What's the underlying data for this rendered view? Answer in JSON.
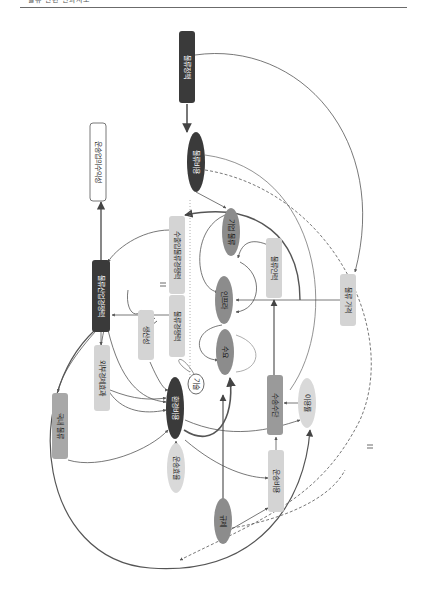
{
  "page": {
    "header_text": "물류 관련 인과지도",
    "rotation_deg": 90
  },
  "colors": {
    "dark_node": "#3a3a3a",
    "mid_node": "#8c8c8c",
    "light_node": "#d4d4d4",
    "edge": "#555555",
    "edge_light": "#9a9a9a"
  },
  "diagram": {
    "nodes": [
      {
        "id": "n1",
        "label": "물류정책",
        "shape": "box",
        "style": "dark",
        "x": 187,
        "y": 67,
        "w": 16,
        "h": 72
      },
      {
        "id": "n2",
        "label": "물류비용",
        "shape": "ellipse",
        "style": "dark",
        "x": 196,
        "y": 162,
        "w": 18,
        "h": 60
      },
      {
        "id": "n3",
        "label": "운송업의수익성",
        "shape": "box",
        "style": "white",
        "x": 98,
        "y": 162,
        "w": 16,
        "h": 78
      },
      {
        "id": "n4",
        "label": "수출입물류경쟁력",
        "shape": "box",
        "style": "light",
        "x": 177,
        "y": 255,
        "w": 16,
        "h": 78
      },
      {
        "id": "n5",
        "label": "기업 물류",
        "shape": "ellipse",
        "style": "mid",
        "x": 231,
        "y": 232,
        "w": 18,
        "h": 48
      },
      {
        "id": "n6",
        "label": "물류인력",
        "shape": "box",
        "style": "light",
        "x": 274,
        "y": 268,
        "w": 16,
        "h": 60
      },
      {
        "id": "n7",
        "label": "물류산업경쟁력",
        "shape": "box",
        "style": "dark",
        "x": 101,
        "y": 296,
        "w": 18,
        "h": 72
      },
      {
        "id": "n8",
        "label": "물류경쟁력",
        "shape": "box",
        "style": "light",
        "x": 177,
        "y": 326,
        "w": 16,
        "h": 62
      },
      {
        "id": "n9",
        "label": "인프라",
        "shape": "ellipse",
        "style": "mid",
        "x": 224,
        "y": 300,
        "w": 18,
        "h": 48
      },
      {
        "id": "n10",
        "label": "생산성",
        "shape": "box",
        "style": "light",
        "x": 146,
        "y": 335,
        "w": 16,
        "h": 50
      },
      {
        "id": "n11",
        "label": "수요",
        "shape": "ellipse",
        "style": "mid",
        "x": 225,
        "y": 352,
        "w": 18,
        "h": 46
      },
      {
        "id": "n12",
        "label": "기술",
        "shape": "ellipse",
        "style": "white",
        "x": 196,
        "y": 384,
        "w": 16,
        "h": 20
      },
      {
        "id": "n13",
        "label": "외부경제효과",
        "shape": "box",
        "style": "light",
        "x": 102,
        "y": 378,
        "w": 16,
        "h": 66
      },
      {
        "id": "n14",
        "label": "환경비용",
        "shape": "ellipse",
        "style": "dark",
        "x": 175,
        "y": 408,
        "w": 18,
        "h": 62
      },
      {
        "id": "n15",
        "label": "국내 물류",
        "shape": "box",
        "style": "light",
        "x": 60,
        "y": 426,
        "w": 16,
        "h": 66
      },
      {
        "id": "n16",
        "label": "수송수단",
        "shape": "box",
        "style": "mid",
        "x": 275,
        "y": 405,
        "w": 16,
        "h": 60
      },
      {
        "id": "n17",
        "label": "이용률",
        "shape": "ellipse",
        "style": "light",
        "x": 307,
        "y": 403,
        "w": 18,
        "h": 50
      },
      {
        "id": "n18",
        "label": "운송효율",
        "shape": "ellipse",
        "style": "light",
        "x": 176,
        "y": 468,
        "w": 18,
        "h": 50
      },
      {
        "id": "n19",
        "label": "운송비용",
        "shape": "box",
        "style": "light",
        "x": 276,
        "y": 481,
        "w": 16,
        "h": 62
      },
      {
        "id": "n20",
        "label": "규제",
        "shape": "ellipse",
        "style": "mid",
        "x": 223,
        "y": 521,
        "w": 18,
        "h": 46
      },
      {
        "id": "n21",
        "label": "물류 가격",
        "shape": "box",
        "style": "light",
        "x": 348,
        "y": 300,
        "w": 16,
        "h": 52
      }
    ]
  }
}
